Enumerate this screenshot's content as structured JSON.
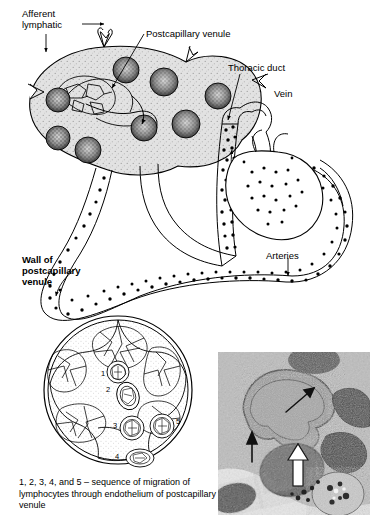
{
  "figure": {
    "type": "anatomical-diagram"
  },
  "labels": {
    "afferent_lymphatic": "Afferent\nlymphatic",
    "postcapillary_venule": "Postcapillary venule",
    "thoracic_duct": "Thoracic duct",
    "vein": "Vein",
    "arteries": "Arteries",
    "wall_of_postcapillary_venule": "Wall of\npostcapillary\nvenule"
  },
  "cross_section": {
    "numbers": [
      "1",
      "2",
      "3",
      "4",
      "5"
    ]
  },
  "caption": "1, 2, 3, 4, and 5 – sequence of migration of lymphocytes through endothelium of postcapillary venule",
  "colors": {
    "ink": "#000000",
    "node_fill": "#d9d9d9",
    "follicle_fill": "#7a7a7a",
    "micrograph_bg": "#b9b9b9",
    "page": "#ffffff"
  },
  "micrograph": {
    "arrows": [
      "arrow-diagonal-upright",
      "arrow-black-up",
      "arrow-white-up"
    ]
  }
}
